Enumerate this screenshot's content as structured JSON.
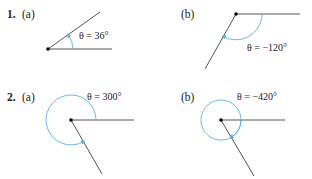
{
  "problems": [
    {
      "number": "1.",
      "parts": [
        {
          "label": "(a)",
          "angle_text": "θ = 36°",
          "degrees": 36,
          "direction": "counterclockwise"
        },
        {
          "label": "(b)",
          "angle_text": "θ = −120°",
          "degrees": -120,
          "direction": "clockwise"
        }
      ]
    },
    {
      "number": "2.",
      "parts": [
        {
          "label": "(a)",
          "angle_text": "θ = 300°",
          "degrees": 300,
          "direction": "counterclockwise"
        },
        {
          "label": "(b)",
          "angle_text": "θ = −420°",
          "degrees": -420,
          "direction": "clockwise"
        }
      ]
    }
  ],
  "colors": {
    "ray": "#555555",
    "arc": "#5ab0dd",
    "vertex": "#000000"
  }
}
